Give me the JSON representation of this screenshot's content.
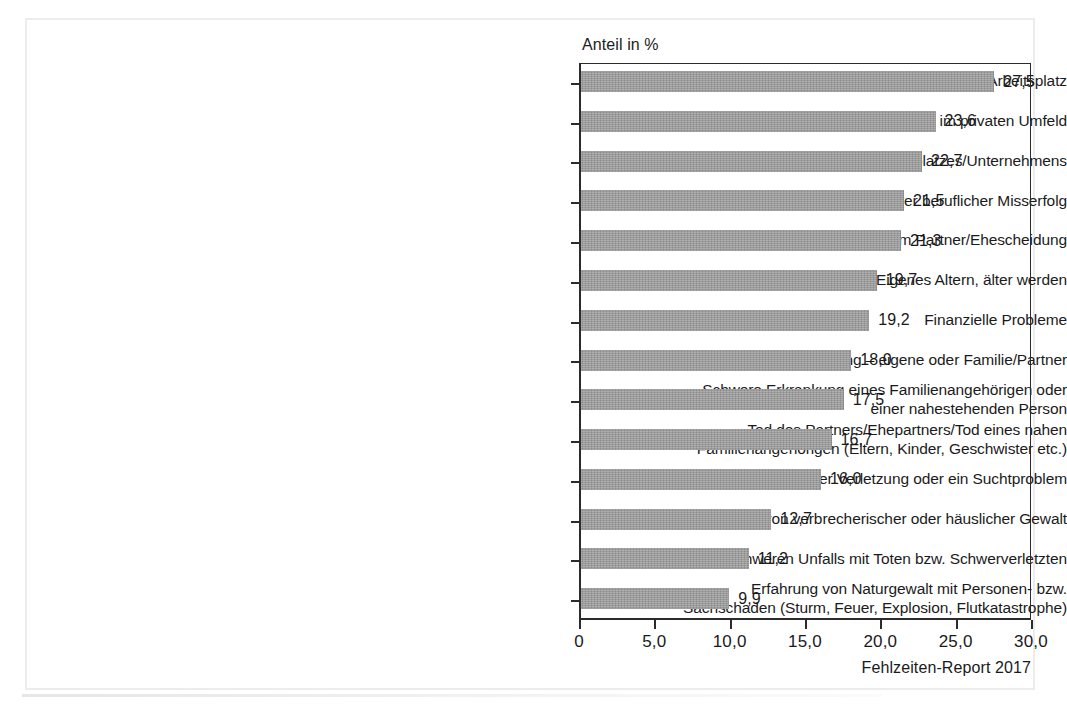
{
  "figure": {
    "axis_title": "Anteil in %",
    "source_note": "Fehlzeiten-Report 2017"
  },
  "chart_data": {
    "type": "bar",
    "orientation": "horizontal",
    "title": "",
    "subtitle": "",
    "xlabel": "Anteil in %",
    "ylabel": "",
    "xlim": [
      0,
      30
    ],
    "grid": false,
    "legend": false,
    "bar_color": "#9b9b9b",
    "value_format": "comma-decimal",
    "xticks": [
      "0",
      "5,0",
      "10,0",
      "15,0",
      "20,0",
      "25,0",
      "30,0"
    ],
    "xtick_values": [
      0,
      5,
      10,
      15,
      20,
      25,
      30
    ],
    "categories": [
      "Streit oder Mobbing am Arbeitsplatz",
      "Belastende Konflikte im privaten Umfeld",
      "Umstrukturierung des Arbeitsplatzes/Unternehmens",
      "Beruflicher Abstieg oder schwerer beruflicher Misserfolg",
      "Trennung vom Partner/Ehescheidung",
      "Eigenes Altern, älter werden",
      "Finanzielle Probleme",
      "Arbeitslosigkeit/Kündigung – eigene oder Familie/Partner",
      "Schwere Erkrankung eines Familienangehörigen oder einer nahestehenden Person",
      "Tod des Partners/Ehepartners/Tod eines nahen Familienangehörigen (Eltern, Kinder, Geschwister etc.)",
      "Eigene schwere Krankheit oder Verletzung oder ein Suchtproblem",
      "Erfahrung von verbrecherischer oder häuslicher Gewalt",
      "Opfer eines schweren Unfalls mit Toten bzw. Schwerverletzten",
      "Erfahrung von Naturgewalt mit Personen- bzw. Sachschaden (Sturm, Feuer, Explosion, Flutkatastrophe)"
    ],
    "category_lines": [
      [
        "Streit oder Mobbing am Arbeitsplatz"
      ],
      [
        "Belastende Konflikte im privaten Umfeld"
      ],
      [
        "Umstrukturierung des Arbeitsplatzes/Unternehmens"
      ],
      [
        "Beruflicher Abstieg oder schwerer beruflicher Misserfolg"
      ],
      [
        "Trennung vom Partner/Ehescheidung"
      ],
      [
        "Eigenes Altern, älter werden"
      ],
      [
        "Finanzielle Probleme"
      ],
      [
        "Arbeitslosigkeit/Kündigung – eigene oder Familie/Partner"
      ],
      [
        "Schwere Erkrankung eines Familienangehörigen oder",
        "einer nahestehenden Person"
      ],
      [
        "Tod des Partners/Ehepartners/Tod eines nahen",
        "Familienangehörigen (Eltern, Kinder, Geschwister etc.)"
      ],
      [
        "Eigene schwere Krankheit oder Verletzung oder ein Suchtproblem"
      ],
      [
        "Erfahrung von verbrecherischer oder häuslicher Gewalt"
      ],
      [
        "Opfer eines schweren Unfalls mit Toten bzw. Schwerverletzten"
      ],
      [
        "Erfahrung von Naturgewalt mit Personen- bzw.",
        "Sachschaden (Sturm, Feuer, Explosion, Flutkatastrophe)"
      ]
    ],
    "values": [
      27.5,
      23.6,
      22.7,
      21.5,
      21.3,
      19.7,
      19.2,
      18.0,
      17.5,
      16.7,
      16.0,
      12.7,
      11.2,
      9.9
    ],
    "value_labels": [
      "27,5",
      "23,6",
      "22,7",
      "21,5",
      "21,3",
      "19,7",
      "19,2",
      "18,0",
      "17,5",
      "16,7",
      "16,0",
      "12,7",
      "11,2",
      "9,9"
    ]
  }
}
